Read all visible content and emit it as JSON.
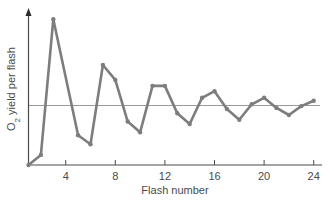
{
  "chart_data": {
    "type": "line",
    "title": "",
    "xlabel": "Flash number",
    "ylabel": "O2 yield per flash",
    "ylabel_parts": {
      "prefix": "O",
      "subscript": "2",
      "suffix": " yield per flash"
    },
    "x_ticks": [
      4,
      8,
      12,
      16,
      20,
      24
    ],
    "y_ticks": [],
    "xlim": [
      1,
      24
    ],
    "ylim": [
      0,
      2.6
    ],
    "grid": false,
    "legend": null,
    "reference_line": {
      "y": 1.0,
      "label": "",
      "color": "#9a9a9a"
    },
    "series": [
      {
        "name": "O2 yield",
        "color": "#7d7d7d",
        "x": [
          1,
          2,
          3,
          5,
          6,
          7,
          8,
          9,
          10,
          11,
          12,
          13,
          14,
          15,
          16,
          17,
          18,
          19,
          20,
          21,
          22,
          23,
          24
        ],
        "values": [
          0.0,
          0.17,
          2.45,
          0.5,
          0.35,
          1.68,
          1.43,
          0.73,
          0.55,
          1.33,
          1.33,
          0.87,
          0.69,
          1.13,
          1.24,
          0.94,
          0.76,
          1.02,
          1.13,
          0.96,
          0.84,
          0.99,
          1.08
        ]
      }
    ]
  },
  "layout": {
    "origin_px": [
      28.5,
      165
    ],
    "px_per_flash": 12.4,
    "px_per_unit": 59.5,
    "x_axis_end_px": 322,
    "y_axis_top_px": 8
  }
}
